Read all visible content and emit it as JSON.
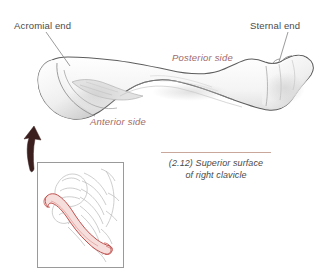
{
  "figure": {
    "kind": "anatomical-illustration",
    "background_color": "#ffffff"
  },
  "labels": {
    "acromial_end": "Acromial end",
    "sternal_end": "Sternal end",
    "posterior_side": "Posterior side",
    "anterior_side": "Anterior side"
  },
  "caption": {
    "number": "(2.12)",
    "line1": "(2.12) Superior surface",
    "line2": "of right clavicle",
    "full": "(2.12) Superior surface of right clavicle",
    "rule_color": "#c9a79a"
  },
  "colors": {
    "label_text": "#4a4a4a",
    "side_label_text": "#a06a6a",
    "bone_outline": "#5d5d5d",
    "bone_fill": "#fbfbfb",
    "bone_shade": "#cfcfcf",
    "leader_line": "#8a8a8a",
    "arrow": "#3b1f1f",
    "inset_border": "#9a9a9a",
    "inset_sketch": "#b9b9b9",
    "inset_clavicle_outline": "#c0504d",
    "inset_clavicle_fill": "#f6dedc"
  },
  "elements": {
    "bone_name": "clavicle-superior-view",
    "arrow_name": "inset-pointer-arrow",
    "inset_name": "shoulder-girdle-inset",
    "leader_acromial": "leader-line-acromial",
    "leader_sternal": "leader-line-sternal"
  }
}
